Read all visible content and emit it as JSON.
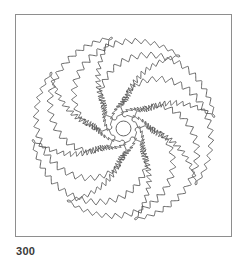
{
  "page": {
    "background_color": "#ffffff",
    "figure_number": "300"
  },
  "frame": {
    "border_color": "#8e8e8e",
    "fill_color": "#ffffff"
  },
  "artwork": {
    "title": "pinwheel-flower-mandala",
    "line_color": "#555555",
    "line_width": 0.9,
    "fill_color": "none",
    "center_circle": {
      "cx": 108,
      "cy": 114,
      "r": 7.5,
      "label": "center-circle"
    },
    "petals": {
      "count": 8,
      "edge_style": "serrated",
      "rotation_step_degrees": 45,
      "spiral_direction": "counter-clockwise",
      "serration_teeth": 21,
      "serration_amplitude": 3.2,
      "inner_radius": 12,
      "outer_radius": 92,
      "sweep_degrees": 128,
      "width_factor": 0.36,
      "start_angles": [
        0,
        45,
        90,
        135,
        180,
        225,
        270,
        315
      ]
    }
  },
  "chart_data": {
    "type": "scatter",
    "categories": [
      "petal 1",
      "petal 2",
      "petal 3",
      "petal 4",
      "petal 5",
      "petal 6",
      "petal 7",
      "petal 8"
    ],
    "values": [
      92,
      92,
      92,
      92,
      92,
      92,
      92,
      92
    ],
    "xlabel": "",
    "ylabel": "",
    "grid": false,
    "legend": "none"
  }
}
